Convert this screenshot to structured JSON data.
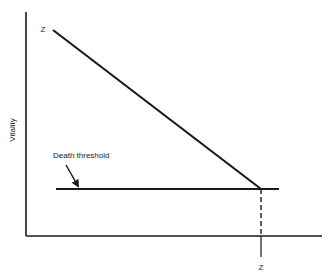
{
  "diagram": {
    "y_axis_label": "Vitality",
    "x_axis_label": "",
    "threshold_label": "Death threshold",
    "start_point_label": "Z",
    "end_point_label": "Z",
    "colors": {
      "line": "#1a1a1a",
      "background": "#ffffff"
    },
    "elements": [
      {
        "type": "axis",
        "name": "y-axis"
      },
      {
        "type": "axis",
        "name": "x-axis"
      },
      {
        "type": "line",
        "name": "vitality-decline-line",
        "from": "Z (top-left)",
        "to": "threshold intersection"
      },
      {
        "type": "line",
        "name": "death-threshold-line"
      },
      {
        "type": "arrow",
        "name": "threshold-pointer-arrow"
      },
      {
        "type": "dashed-line",
        "name": "time-drop-line",
        "to": "Z (x-axis)"
      }
    ]
  }
}
